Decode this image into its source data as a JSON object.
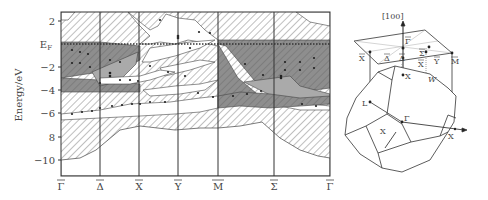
{
  "figure": {
    "left_panel": {
      "y_axis_label": "Energy/eV",
      "y_ticks": [
        {
          "label": "2",
          "value": 2
        },
        {
          "label": "E",
          "sub": "F",
          "value": 0
        },
        {
          "label": "−2",
          "value": -2
        },
        {
          "label": "−4",
          "value": -4
        },
        {
          "label": "−6",
          "value": -6
        },
        {
          "label": "8",
          "value": -8
        },
        {
          "label": "−10",
          "value": -10
        }
      ],
      "x_points": [
        {
          "label": "Γ",
          "overline": true
        },
        {
          "label": "Δ",
          "overline": true
        },
        {
          "label": "X",
          "overline": true
        },
        {
          "label": "Y",
          "overline": true
        },
        {
          "label": "M",
          "overline": true
        },
        {
          "label": "Σ",
          "overline": true
        },
        {
          "label": "Γ",
          "overline": true
        }
      ]
    },
    "right_panel": {
      "direction_label": "[100]",
      "surface_points": [
        "Γ",
        "X",
        "Δ",
        "Δ",
        "Σ",
        "X",
        "Y",
        "M"
      ],
      "bulk_points": [
        "X",
        "W",
        "L",
        "Γ",
        "X",
        "X"
      ]
    },
    "colors": {
      "line": "#333333",
      "dark_region": "#8a8a8a",
      "mid_region": "#a9a9a9",
      "hatch": "#7a7a7a"
    }
  }
}
